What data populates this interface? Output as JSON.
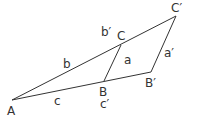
{
  "diagram": {
    "points": {
      "A": {
        "label": "A"
      },
      "B": {
        "label": "B"
      },
      "Bp": {
        "label": "B′"
      },
      "C": {
        "label": "C"
      },
      "Cp": {
        "label": "C′"
      }
    },
    "side_labels": {
      "a": "a",
      "a_prime": "a′",
      "b": "b",
      "b_prime": "b′",
      "c": "c",
      "c_prime": "c′"
    },
    "segments": [
      {
        "from": "A",
        "to": "Cp"
      },
      {
        "from": "A",
        "to": "Bp"
      },
      {
        "from": "B",
        "to": "C"
      },
      {
        "from": "Bp",
        "to": "Cp"
      }
    ]
  }
}
